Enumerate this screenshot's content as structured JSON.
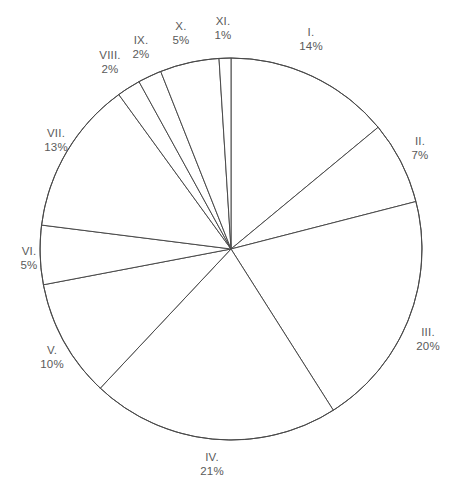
{
  "chart_data": {
    "type": "pie",
    "title": "",
    "subtitle": "",
    "xlabel": "",
    "ylabel": "",
    "legend_position": "none",
    "grid": false,
    "labels_outside": true,
    "start_angle_deg": 0,
    "direction": "clockwise",
    "total_percent": 100,
    "categories": [
      "I.",
      "II.",
      "III.",
      "IV.",
      "V.",
      "VI.",
      "VII.",
      "VIII.",
      "IX.",
      "X.",
      "XI."
    ],
    "values": [
      14,
      7,
      20,
      21,
      10,
      5,
      13,
      2,
      2,
      5,
      1
    ],
    "value_labels": [
      "14%",
      "7%",
      "20%",
      "21%",
      "10%",
      "5%",
      "13%",
      "2%",
      "2%",
      "5%",
      "1%"
    ],
    "slices": [
      {
        "name": "I.",
        "value": 14,
        "value_label": "14%",
        "label_x": 311,
        "label_y": 39
      },
      {
        "name": "II.",
        "value": 7,
        "value_label": "7%",
        "label_x": 420,
        "label_y": 148
      },
      {
        "name": "III.",
        "value": 20,
        "value_label": "20%",
        "label_x": 428,
        "label_y": 339
      },
      {
        "name": "IV.",
        "value": 21,
        "value_label": "21%",
        "label_x": 212,
        "label_y": 464
      },
      {
        "name": "V.",
        "value": 10,
        "value_label": "10%",
        "label_x": 52,
        "label_y": 357
      },
      {
        "name": "VI.",
        "value": 5,
        "value_label": "5%",
        "label_x": 29,
        "label_y": 258
      },
      {
        "name": "VII.",
        "value": 13,
        "value_label": "13%",
        "label_x": 56,
        "label_y": 140
      },
      {
        "name": "VIII.",
        "value": 2,
        "value_label": "2%",
        "label_x": 110,
        "label_y": 62
      },
      {
        "name": "IX.",
        "value": 2,
        "value_label": "2%",
        "label_x": 141,
        "label_y": 47
      },
      {
        "name": "X.",
        "value": 5,
        "value_label": "5%",
        "label_x": 181,
        "label_y": 33
      },
      {
        "name": "XI.",
        "value": 1,
        "value_label": "1%",
        "label_x": 223,
        "label_y": 28
      }
    ],
    "geometry": {
      "center_x": 231,
      "center_y": 249,
      "radius": 191
    },
    "colors": {
      "background": "#ffffff",
      "slice_fill": "#ffffff",
      "slice_stroke": "#4a4a4a",
      "label_text": "#5a5a5a"
    }
  }
}
